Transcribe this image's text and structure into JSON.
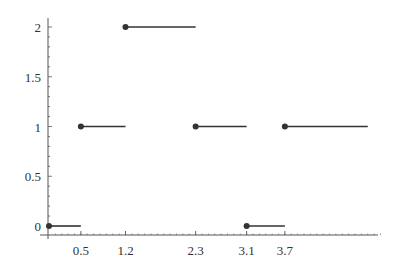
{
  "chart_data": {
    "type": "line",
    "subtype": "step",
    "title": "",
    "xlabel": "",
    "ylabel": "",
    "xlim": [
      0,
      5.2
    ],
    "ylim": [
      0,
      2
    ],
    "grid": false,
    "legend": null,
    "x_ticks": [
      "0.5",
      "1.2",
      "2.3",
      "3.1",
      "3.7"
    ],
    "x_tick_values": [
      0.5,
      1.2,
      2.3,
      3.1,
      3.7
    ],
    "y_ticks": [
      "0",
      "0.5",
      "1",
      "1.5",
      "2"
    ],
    "y_tick_values": [
      0,
      0.5,
      1,
      1.5,
      2
    ],
    "segments": [
      {
        "x_start": 0.0,
        "x_end": 0.5,
        "y": 0,
        "closed_start": true
      },
      {
        "x_start": 0.5,
        "x_end": 1.2,
        "y": 1,
        "closed_start": true
      },
      {
        "x_start": 1.2,
        "x_end": 2.3,
        "y": 2,
        "closed_start": true
      },
      {
        "x_start": 2.3,
        "x_end": 3.1,
        "y": 1,
        "closed_start": true
      },
      {
        "x_start": 3.1,
        "x_end": 3.7,
        "y": 0,
        "closed_start": true
      },
      {
        "x_start": 3.7,
        "x_end": 5.0,
        "y": 1,
        "closed_start": true
      }
    ],
    "colors": {
      "line": "#333333",
      "axis": "#555555"
    }
  }
}
